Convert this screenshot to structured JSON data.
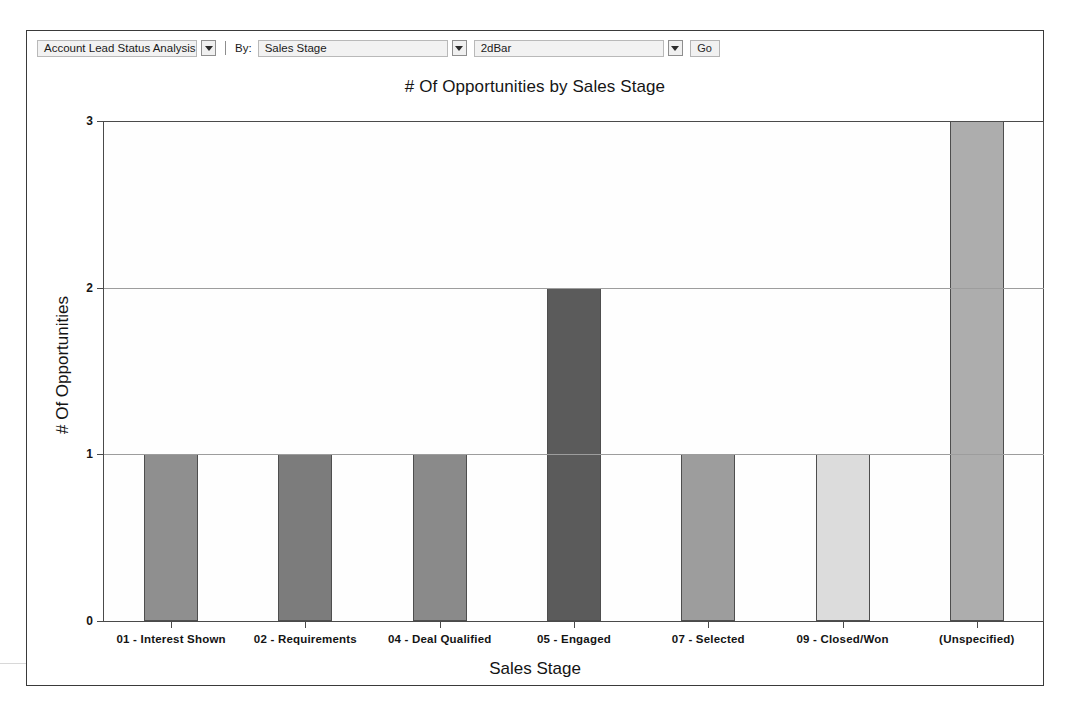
{
  "toolbar": {
    "report_select": {
      "value": "Account Lead Status Analysis",
      "arrow_icon": "chevron-down-icon"
    },
    "by_label": "By:",
    "group_select": {
      "value": "Sales Stage",
      "arrow_icon": "chevron-down-icon"
    },
    "charttype_select": {
      "value": "2dBar",
      "arrow_icon": "chevron-down-icon"
    },
    "go_label": "Go"
  },
  "chart_data": {
    "type": "bar",
    "title": "# Of Opportunities by Sales Stage",
    "xlabel": "Sales Stage",
    "ylabel": "# Of Opportunities",
    "categories": [
      "01 - Interest Shown",
      "02 - Requirements",
      "04 - Deal Qualified",
      "05 - Engaged",
      "07 - Selected",
      "09 - Closed/Won",
      "(Unspecified)"
    ],
    "values": [
      1,
      1,
      1,
      2,
      1,
      1,
      3
    ],
    "bar_colors": [
      "#8f8f8f",
      "#7c7c7c",
      "#8a8a8a",
      "#5b5b5b",
      "#9d9d9d",
      "#dcdcdc",
      "#adadad"
    ],
    "ylim": [
      0,
      3
    ],
    "yticks": [
      0,
      1,
      2,
      3
    ],
    "ytick_labels": [
      "0",
      "1",
      "2",
      "3"
    ],
    "grid": true,
    "legend": "none"
  }
}
